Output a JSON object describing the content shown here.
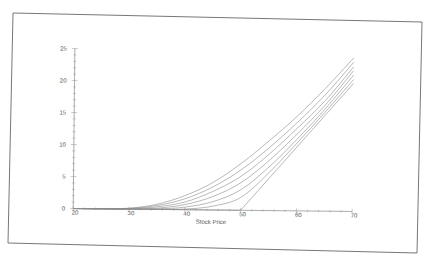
{
  "chart_data": {
    "type": "line",
    "title": "",
    "xlabel": "Stock Price",
    "ylabel": "",
    "xlim": [
      20,
      70
    ],
    "ylim": [
      0,
      25
    ],
    "x_ticks": [
      20,
      30,
      40,
      50,
      60,
      70
    ],
    "y_ticks": [
      0,
      5,
      10,
      15,
      20,
      25
    ],
    "grid": false,
    "legend": "none",
    "x": [
      20,
      25,
      30,
      35,
      40,
      45,
      50,
      55,
      60,
      65,
      70
    ],
    "series": [
      {
        "name": "curve-1",
        "values": [
          0,
          0.02,
          0.15,
          0.8,
          2.2,
          4.3,
          7.3,
          10.9,
          14.8,
          19.2,
          24.0
        ]
      },
      {
        "name": "curve-2",
        "values": [
          0,
          0.01,
          0.1,
          0.6,
          1.7,
          3.6,
          6.3,
          9.8,
          13.8,
          18.2,
          23.3
        ]
      },
      {
        "name": "curve-3",
        "values": [
          0,
          0,
          0.06,
          0.4,
          1.2,
          2.9,
          5.3,
          8.8,
          12.9,
          17.3,
          22.6
        ]
      },
      {
        "name": "curve-4",
        "values": [
          0,
          0,
          0.03,
          0.2,
          0.8,
          2.1,
          4.3,
          7.8,
          12.0,
          16.6,
          22.0
        ]
      },
      {
        "name": "curve-5",
        "values": [
          0,
          0,
          0.01,
          0.08,
          0.4,
          1.3,
          3.2,
          6.8,
          11.2,
          16.0,
          21.3
        ]
      },
      {
        "name": "curve-6",
        "values": [
          0,
          0,
          0,
          0.02,
          0.1,
          0.6,
          2.0,
          5.9,
          10.6,
          15.5,
          20.6
        ]
      },
      {
        "name": "intrinsic",
        "values": [
          0,
          0,
          0,
          0,
          0,
          0,
          0,
          5,
          10,
          15,
          20
        ]
      }
    ]
  }
}
